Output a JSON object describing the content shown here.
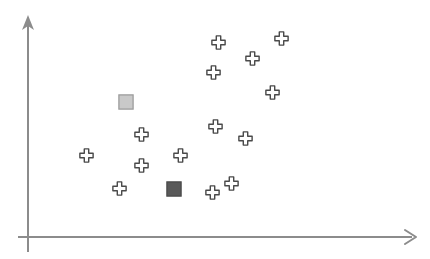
{
  "figure": {
    "type": "scatter-plot-diagram",
    "width": 430,
    "height": 259,
    "background_color": "#ffffff",
    "title": ""
  },
  "axes": {
    "color": "#8c8c8c",
    "line_width": 2,
    "y_axis": {
      "name": "y-axis",
      "label": "",
      "x": 28,
      "y_top": 17,
      "y_bottom": 252,
      "arrow": "up",
      "arrow_style": "filled-triangle"
    },
    "x_axis": {
      "name": "x-axis",
      "label": "",
      "y": 237,
      "x_left": 18,
      "x_right": 416,
      "arrow": "right",
      "arrow_style": "open-chevron"
    },
    "tick_labels_x": [],
    "tick_labels_y": [],
    "grid": false
  },
  "legend": {
    "visible": false,
    "entries": []
  },
  "chart_data": {
    "type": "scatter",
    "title": "",
    "xlabel": "",
    "ylabel": "",
    "grid": false,
    "legend_position": "none",
    "series": [
      {
        "name": "cross-points",
        "marker": "cross",
        "marker_size": 15,
        "fill_color": "#ffffff",
        "stroke_color": "#4a4a4a",
        "points": [
          {
            "x": 218,
            "y": 42
          },
          {
            "x": 281,
            "y": 38
          },
          {
            "x": 252,
            "y": 58
          },
          {
            "x": 213,
            "y": 72
          },
          {
            "x": 272,
            "y": 92
          },
          {
            "x": 141,
            "y": 134
          },
          {
            "x": 215,
            "y": 126
          },
          {
            "x": 245,
            "y": 138
          },
          {
            "x": 86,
            "y": 155
          },
          {
            "x": 141,
            "y": 165
          },
          {
            "x": 180,
            "y": 155
          },
          {
            "x": 119,
            "y": 188
          },
          {
            "x": 212,
            "y": 192
          },
          {
            "x": 231,
            "y": 183
          }
        ]
      },
      {
        "name": "light-square-point",
        "marker": "square",
        "marker_size": 16,
        "fill_color": "#c9c9c9",
        "stroke_color": "#9a9a9a",
        "points": [
          {
            "x": 126,
            "y": 102
          }
        ]
      },
      {
        "name": "dark-square-point",
        "marker": "square",
        "marker_size": 16,
        "fill_color": "#595959",
        "stroke_color": "#4a4a4a",
        "points": [
          {
            "x": 174,
            "y": 189
          }
        ]
      }
    ]
  }
}
